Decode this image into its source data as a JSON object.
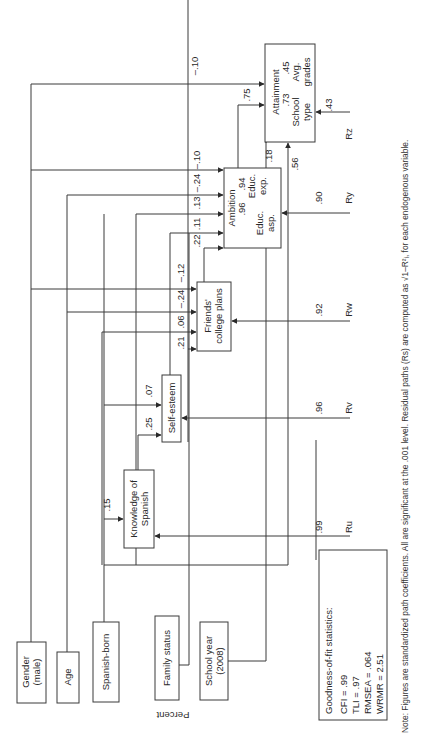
{
  "orientation": "rotated-90-ccw",
  "variables": {
    "gender": [
      "Gender",
      "(male)"
    ],
    "age": "Age",
    "spanish_born": "Spanish-born",
    "family_status": "Family status",
    "school_year": [
      "School year",
      "(2008)"
    ],
    "knowledge_spanish": [
      "Knowledge of",
      "Spanish"
    ],
    "self_esteem": "Self-esteem",
    "friends_plans": [
      "Friends'",
      "college plans"
    ],
    "ambition": {
      "title": "Ambition",
      "sub1": [
        "Educ.",
        "asp."
      ],
      "sub2": [
        "Educ.",
        "exp."
      ],
      "load1": ".96",
      "load2": ".94"
    },
    "attainment": {
      "title": "Attainment",
      "sub1": [
        "School",
        "type"
      ],
      "sub2": [
        "Avg.",
        "grades"
      ],
      "load1": ".73",
      "load2": ".45"
    }
  },
  "paths": {
    "gender_attainment": "–.10",
    "gender_ambition": "–.10",
    "age_ambition": "–.24",
    "spanishborn_ambition": ".13",
    "familystatus_ambition": ".11",
    "friends_ambition": ".22",
    "gender_friends": "–.12",
    "age_friends": "–.24",
    "spanishborn_friends": ".06",
    "selfesteem_friends": ".21",
    "spanishborn_selfesteem": ".07",
    "knowledge_selfesteem": ".25",
    "spanishborn_knowledge": ".15",
    "ambition_attainment": ".75",
    "schoolyear_attainment_a": ".18",
    "schoolyear_attainment_b": ".56"
  },
  "residuals": {
    "ru": {
      "label": "Ru",
      "value": ".99"
    },
    "rv": {
      "label": "Rv",
      "value": ".96"
    },
    "rw": {
      "label": "Rw",
      "value": ".92"
    },
    "ry": {
      "label": "Ry",
      "value": ".90"
    },
    "rz": {
      "label": "Rz",
      "value": ".43"
    }
  },
  "axis_label": "Percent",
  "fit": {
    "title": "Goodness-of-fit statistics:",
    "cfi": "CFI = .99",
    "tli": "TLI = .97",
    "rmsea": "RMSEA = .064",
    "wrmr": "WRMR = 2.51"
  },
  "note": "Note: Figures are standardized path coefficients. All are significant at the .001 level. Residual paths (Rs) are computed as √1–R²ᵢ, for each endogenous variable."
}
